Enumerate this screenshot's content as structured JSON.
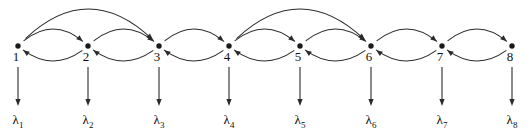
{
  "diagram": {
    "type": "state-transition-chain",
    "background_color": "#ffffff",
    "stroke_color": "#2b2b2b",
    "node_color": "#1a1a1a",
    "nodes": [
      {
        "id": 1,
        "label": "1",
        "x": 18,
        "y": 46
      },
      {
        "id": 2,
        "label": "2",
        "x": 88,
        "y": 46
      },
      {
        "id": 3,
        "label": "3",
        "x": 159,
        "y": 46
      },
      {
        "id": 4,
        "label": "4",
        "x": 229,
        "y": 46
      },
      {
        "id": 5,
        "label": "5",
        "x": 300,
        "y": 46
      },
      {
        "id": 6,
        "label": "6",
        "x": 371,
        "y": 46
      },
      {
        "id": 7,
        "label": "7",
        "x": 442,
        "y": 46
      },
      {
        "id": 8,
        "label": "8",
        "x": 512,
        "y": 46
      }
    ],
    "forward_edges": [
      {
        "from": 1,
        "to": 2
      },
      {
        "from": 2,
        "to": 3
      },
      {
        "from": 3,
        "to": 4
      },
      {
        "from": 4,
        "to": 5
      },
      {
        "from": 5,
        "to": 6
      },
      {
        "from": 6,
        "to": 7
      },
      {
        "from": 7,
        "to": 8
      }
    ],
    "backward_edges": [
      {
        "from": 2,
        "to": 1
      },
      {
        "from": 3,
        "to": 2
      },
      {
        "from": 4,
        "to": 3
      },
      {
        "from": 5,
        "to": 4
      },
      {
        "from": 6,
        "to": 5
      },
      {
        "from": 7,
        "to": 6
      },
      {
        "from": 8,
        "to": 7
      }
    ],
    "skip_edges": [
      {
        "from": 1,
        "to": 3
      },
      {
        "from": 4,
        "to": 6
      }
    ],
    "rate_arrows": [
      {
        "node": 1,
        "label": "λ",
        "subscript": "1",
        "x": 18,
        "y_start": 67,
        "y_end": 106,
        "label_y": 124
      },
      {
        "node": 2,
        "label": "λ",
        "subscript": "2",
        "x": 88,
        "y_start": 67,
        "y_end": 106,
        "label_y": 124
      },
      {
        "node": 3,
        "label": "λ",
        "subscript": "3",
        "x": 159,
        "y_start": 67,
        "y_end": 106,
        "label_y": 124
      },
      {
        "node": 4,
        "label": "λ",
        "subscript": "4",
        "x": 229,
        "y_start": 67,
        "y_end": 106,
        "label_y": 124
      },
      {
        "node": 5,
        "label": "λ",
        "subscript": "5",
        "x": 300,
        "y_start": 67,
        "y_end": 106,
        "label_y": 124
      },
      {
        "node": 6,
        "label": "λ",
        "subscript": "6",
        "x": 371,
        "y_start": 67,
        "y_end": 106,
        "label_y": 124
      },
      {
        "node": 7,
        "label": "λ",
        "subscript": "7",
        "x": 442,
        "y_start": 67,
        "y_end": 106,
        "label_y": 124
      },
      {
        "node": 8,
        "label": "λ",
        "subscript": "8",
        "x": 512,
        "y_start": 67,
        "y_end": 106,
        "label_y": 124
      }
    ]
  }
}
